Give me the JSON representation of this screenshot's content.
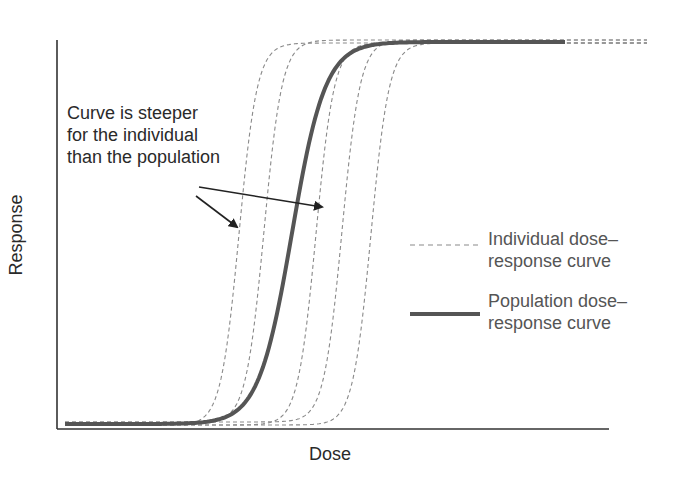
{
  "chart_data": {
    "type": "line",
    "title": "",
    "xlabel": "Dose",
    "ylabel": "Response",
    "grid": false,
    "ticks": false,
    "xlim": [
      0,
      1
    ],
    "ylim": [
      0,
      1
    ],
    "legend_position": "right-middle",
    "legend": [
      {
        "name": "Individual dose–response curve",
        "style": "dashed",
        "color": "#8a8a8a"
      },
      {
        "name": "Population dose–response curve",
        "style": "solid-thick",
        "color": "#555555"
      }
    ],
    "series": [
      {
        "name": "Individual 1",
        "kind": "individual",
        "midpoint_px": 239,
        "steepness": 0.11
      },
      {
        "name": "Individual 2",
        "kind": "individual",
        "midpoint_px": 264,
        "steepness": 0.11
      },
      {
        "name": "Individual 3",
        "kind": "individual",
        "midpoint_px": 316,
        "steepness": 0.11
      },
      {
        "name": "Individual 4",
        "kind": "individual",
        "midpoint_px": 342,
        "steepness": 0.11
      },
      {
        "name": "Individual 5",
        "kind": "individual",
        "midpoint_px": 371,
        "steepness": 0.11
      },
      {
        "name": "Population",
        "kind": "population",
        "midpoint_px": 292,
        "steepness": 0.06
      }
    ],
    "annotation": {
      "text": [
        "Curve is steeper",
        "for the individual",
        "than the population"
      ],
      "arrows": [
        {
          "from": [
            196,
            196
          ],
          "to": [
            237,
            227
          ]
        },
        {
          "from": [
            199,
            187
          ],
          "to": [
            322,
            207
          ]
        }
      ]
    }
  },
  "labels": {
    "xlabel": "Dose",
    "ylabel": "Response",
    "annotation_line1": "Curve is steeper",
    "annotation_line2": "for the individual",
    "annotation_line3": "than the population",
    "legend_individual_line1": "Individual dose–",
    "legend_individual_line2": "response curve",
    "legend_population_line1": "Population dose–",
    "legend_population_line2": "response curve"
  },
  "colors": {
    "axis": "#333333",
    "individual": "#8a8a8a",
    "population": "#555555",
    "arrow": "#222222"
  }
}
